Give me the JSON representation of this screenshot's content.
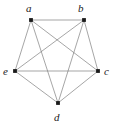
{
  "figure": {
    "width": 117,
    "height": 134,
    "background_color": "#ffffff",
    "edge_color": "#808080",
    "vertex_color": "#1a1a1a",
    "label_color": "#222222",
    "edge_width": 0.7,
    "vertex_radius": 1.9
  },
  "chart_data": {
    "type": "diagram",
    "diagram_type": "graph",
    "title": "",
    "graph_name": "K5",
    "directed": false,
    "node_count": 5,
    "edge_count": 10,
    "nodes": [
      {
        "id": "a",
        "label": "a",
        "x": 31,
        "y": 20,
        "label_x": 26,
        "label_y": 3,
        "label_anchor": "above-left"
      },
      {
        "id": "b",
        "label": "b",
        "x": 84,
        "y": 20,
        "label_x": 78,
        "label_y": 3,
        "label_anchor": "above-left"
      },
      {
        "id": "c",
        "label": "c",
        "x": 98,
        "y": 71,
        "label_x": 104,
        "label_y": 66,
        "label_anchor": "right"
      },
      {
        "id": "d",
        "label": "d",
        "x": 58,
        "y": 103,
        "label_x": 54,
        "label_y": 112,
        "label_anchor": "below"
      },
      {
        "id": "e",
        "label": "e",
        "x": 15,
        "y": 71,
        "label_x": 3,
        "label_y": 66,
        "label_anchor": "left"
      }
    ],
    "edges": [
      {
        "source": "a",
        "target": "b"
      },
      {
        "source": "a",
        "target": "c"
      },
      {
        "source": "a",
        "target": "d"
      },
      {
        "source": "a",
        "target": "e"
      },
      {
        "source": "b",
        "target": "c"
      },
      {
        "source": "b",
        "target": "d"
      },
      {
        "source": "b",
        "target": "e"
      },
      {
        "source": "c",
        "target": "d"
      },
      {
        "source": "c",
        "target": "e"
      },
      {
        "source": "d",
        "target": "e"
      }
    ]
  }
}
